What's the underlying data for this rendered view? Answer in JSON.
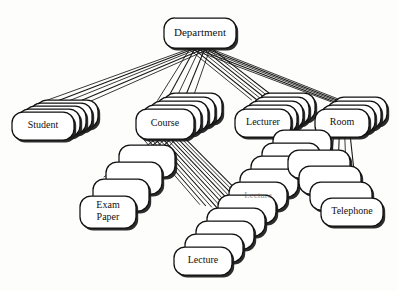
{
  "diagram": {
    "background_color": "#fdfdfc",
    "line_color": "#151515",
    "node_fill": "#ffffff",
    "node_stroke": "#101010",
    "nodes": [
      {
        "id": "department",
        "label": "Department",
        "label_lines": [
          "Department"
        ],
        "x": 200,
        "y": 33,
        "w": 72,
        "h": 30,
        "stack": 1,
        "stack_dx": 0,
        "stack_dy": 0,
        "font_size": 11
      },
      {
        "id": "student",
        "label": "Student",
        "label_lines": [
          "Student"
        ],
        "x": 43,
        "y": 126,
        "w": 62,
        "h": 28,
        "stack": 5,
        "stack_dx": 6,
        "stack_dy": -3,
        "font_size": 10
      },
      {
        "id": "course",
        "label": "Course",
        "label_lines": [
          "Course"
        ],
        "x": 165,
        "y": 124,
        "w": 58,
        "h": 30,
        "stack": 5,
        "stack_dx": 7,
        "stack_dy": -4,
        "font_size": 10
      },
      {
        "id": "lecturer",
        "label": "Lecturer",
        "label_lines": [
          "Lecturer"
        ],
        "x": 263,
        "y": 123,
        "w": 56,
        "h": 28,
        "stack": 5,
        "stack_dx": 6,
        "stack_dy": -4,
        "font_size": 10
      },
      {
        "id": "room",
        "label": "Room",
        "label_lines": [
          "Room"
        ],
        "x": 342,
        "y": 123,
        "w": 54,
        "h": 28,
        "stack": 4,
        "stack_dx": 6,
        "stack_dy": -4,
        "font_size": 10
      },
      {
        "id": "exam-paper",
        "label": "Exam Paper",
        "label_lines": [
          "Exam",
          "Paper"
        ],
        "x": 108,
        "y": 212,
        "w": 56,
        "h": 32,
        "stack": 4,
        "stack_dx": 13,
        "stack_dy": -17,
        "font_size": 10
      },
      {
        "id": "lecture",
        "label": "Lecture",
        "label_lines": [
          "Lecture"
        ],
        "x": 203,
        "y": 261,
        "w": 58,
        "h": 28,
        "stack": 10,
        "stack_dx": 11,
        "stack_dy": -13,
        "font_size": 10
      },
      {
        "id": "telephone",
        "label": "Telephone",
        "label_lines": [
          "Telephone"
        ],
        "x": 352,
        "y": 212,
        "w": 62,
        "h": 28,
        "stack": 4,
        "stack_dx": -11,
        "stack_dy": -16,
        "font_size": 10
      }
    ],
    "edges": [
      {
        "from": "department",
        "to": "student",
        "bundle": 5
      },
      {
        "from": "department",
        "to": "course",
        "bundle": 5
      },
      {
        "from": "department",
        "to": "lecturer",
        "bundle": 6
      },
      {
        "from": "department",
        "to": "room",
        "bundle": 5
      },
      {
        "from": "course",
        "to": "exam-paper",
        "bundle": 5
      },
      {
        "from": "course",
        "to": "lecture",
        "bundle": 12
      },
      {
        "from": "room",
        "to": "telephone",
        "bundle": 4
      }
    ],
    "ghost_label": "Lecture"
  }
}
